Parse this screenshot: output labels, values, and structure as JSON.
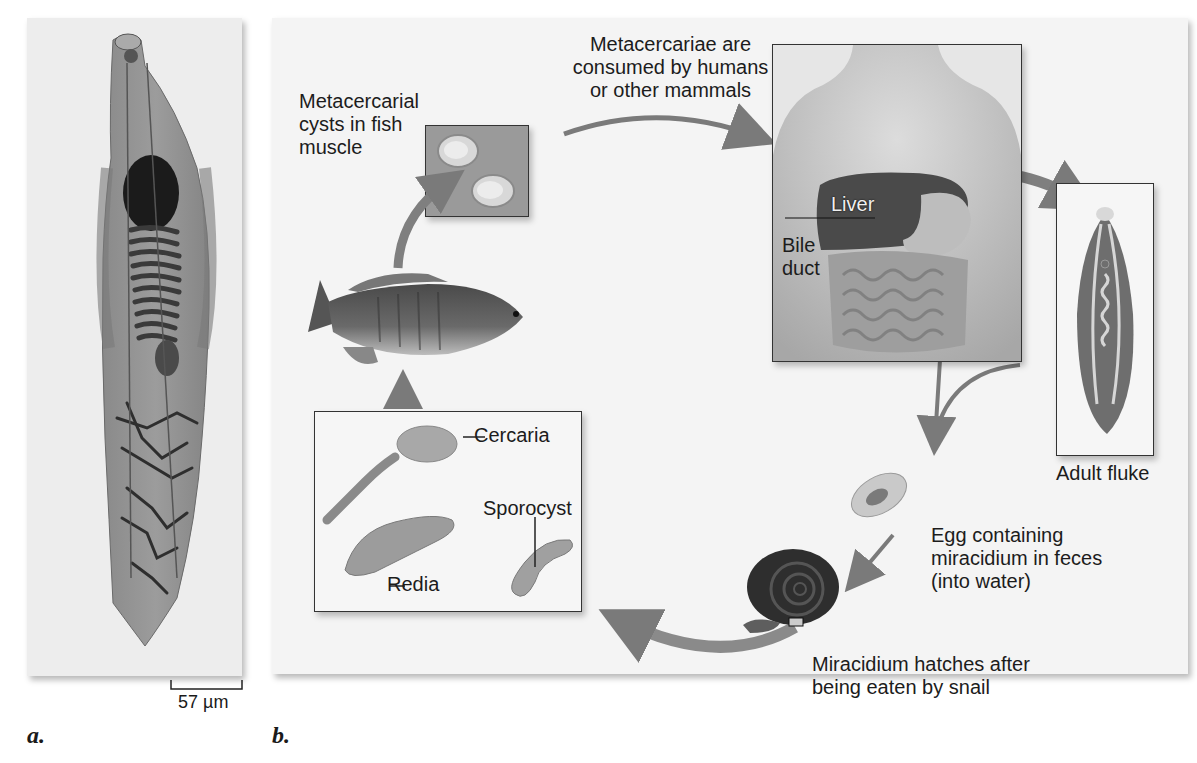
{
  "figure": {
    "panel_a": {
      "letter": "a.",
      "scale_bar": "57 µm",
      "subject": "Micrograph of liver fluke (Clonorchis)"
    },
    "panel_b": {
      "letter": "b.",
      "labels": {
        "metacercarial_cysts": [
          "Metacercarial",
          "cysts in fish",
          "muscle"
        ],
        "consumed": [
          "Metacercariae are",
          "consumed by humans",
          "or other mammals"
        ],
        "liver": "Liver",
        "bile_duct": [
          "Bile",
          "duct"
        ],
        "adult_fluke": "Adult fluke",
        "egg": [
          "Egg containing",
          "miracidium in feces",
          "(into water)"
        ],
        "miracidium": [
          "Miracidium hatches after",
          "being eaten by snail"
        ],
        "cercaria": "Cercaria",
        "sporocyst": "Sporocyst",
        "redia": "Redia"
      }
    },
    "colors": {
      "arrow": "#7a7a7a",
      "liver": "#4a4a4a",
      "panel_bg": "#f3f3f3",
      "box_border": "#333333"
    }
  }
}
